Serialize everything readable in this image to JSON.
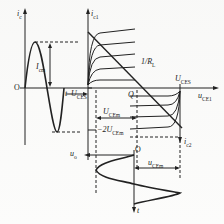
{
  "figure": {
    "type": "push-pull amplifier graphical analysis",
    "labels": {
      "ic_left": {
        "main": "i",
        "sub": "c"
      },
      "ic1": {
        "main": "i",
        "sub": "c1"
      },
      "ic2": {
        "main": "i",
        "sub": "c2"
      },
      "icm": {
        "main": "I",
        "sub": "cm"
      },
      "origin_left": "O",
      "t_left": "t",
      "uces_left": {
        "main": "U",
        "sub": "CES"
      },
      "uces_right": {
        "main": "U",
        "sub": "CES"
      },
      "load_slope": {
        "main": "1/R",
        "sub": "L"
      },
      "q_point": "Q",
      "uce1": {
        "main": "u",
        "sub": "CE1"
      },
      "ucem": {
        "main": "U",
        "sub": "CEm"
      },
      "two_ucem": {
        "prefix": "−2",
        "main": "U",
        "sub": "CEm"
      },
      "uo": {
        "main": "u",
        "sub": "o"
      },
      "origin_bottom": "O",
      "ucem_bottom": {
        "main": "u",
        "sub": "CEm"
      },
      "t_bottom": "t"
    }
  }
}
